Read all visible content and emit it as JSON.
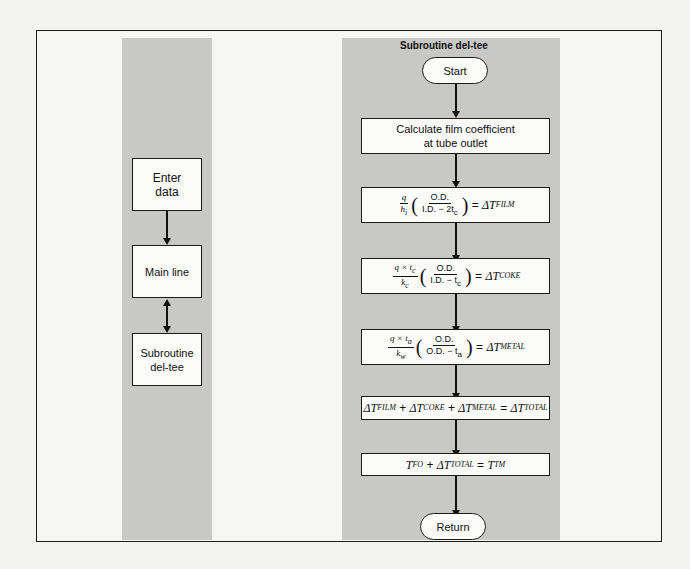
{
  "left_flow": {
    "nodes": [
      {
        "id": "enter",
        "label_line1": "Enter",
        "label_line2": "data"
      },
      {
        "id": "main",
        "label": "Main line"
      },
      {
        "id": "sub",
        "label_line1": "Subroutine",
        "label_line2": "del-tee"
      }
    ],
    "connectors": [
      "enter->main (down arrow)",
      "main<->sub (bidirectional arrow)"
    ]
  },
  "right_flow": {
    "title": "Subroutine del-tee",
    "start": "Start",
    "step1_line1": "Calculate film coefficient",
    "step1_line2": "at tube outlet",
    "step2": {
      "num": "q",
      "den": "h",
      "den_sub": "i",
      "frac_num": "O.D.",
      "frac_den": "I.D. − 2t",
      "frac_den_sub": "c",
      "result": "ΔT",
      "result_sub": "FILM"
    },
    "step3": {
      "num": "q × t",
      "num_sub": "c",
      "den": "k",
      "den_sub": "c",
      "frac_num": "O.D.",
      "frac_den": "I.D. − t",
      "frac_den_sub": "c",
      "result": "ΔT",
      "result_sub": "COKE"
    },
    "step4": {
      "num": "q × t",
      "num_sub": "a",
      "den": "k",
      "den_sub": "w",
      "frac_num": "O.D.",
      "frac_den": "O.D. − t",
      "frac_den_sub": "a",
      "result": "ΔT",
      "result_sub": "METAL"
    },
    "step5": {
      "t1": "ΔT",
      "s1": "FILM",
      "t2": "ΔT",
      "s2": "COKE",
      "t3": "ΔT",
      "s3": "METAL",
      "t4": "ΔT",
      "s4": "TOTAL"
    },
    "step6": {
      "t1": "T",
      "s1": "FO",
      "t2": "ΔT",
      "s2": "TOTAL",
      "t3": "T",
      "s3": "TM"
    },
    "end": "Return"
  }
}
